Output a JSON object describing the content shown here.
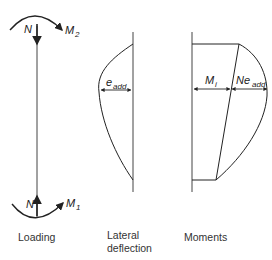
{
  "diagram": {
    "panels": [
      {
        "id": "loading",
        "caption": "Loading",
        "labels": {
          "top_force": "N",
          "top_moment": "M",
          "top_moment_sub": "2",
          "bottom_force": "N",
          "bottom_moment": "M",
          "bottom_moment_sub": "1"
        }
      },
      {
        "id": "lateral-deflection",
        "caption_line1": "Lateral",
        "caption_line2": "deflection",
        "labels": {
          "deflection": "e",
          "deflection_sub": "add"
        }
      },
      {
        "id": "moments",
        "caption": "Moments",
        "labels": {
          "initial_moment": "M",
          "initial_moment_sub": "i",
          "additional_moment": "Ne",
          "additional_moment_sub": "add"
        }
      }
    ],
    "colors": {
      "line": "#222222",
      "dimension": "#888888",
      "background": "#ffffff"
    }
  }
}
